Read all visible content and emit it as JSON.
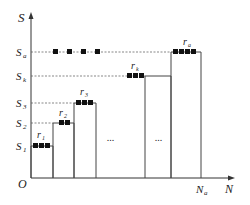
{
  "diagram": {
    "axes": {
      "y_label": "S",
      "x_label": "N",
      "origin_label": "O",
      "x_end_tick_label": "N",
      "x_end_tick_sub": "a"
    },
    "y_levels": [
      {
        "label": "S",
        "sub": "1",
        "y": 146
      },
      {
        "label": "S",
        "sub": "2",
        "y": 123
      },
      {
        "label": "S",
        "sub": "3",
        "y": 103
      },
      {
        "label": "S",
        "sub": "k",
        "y": 76
      },
      {
        "label": "S",
        "sub": "a",
        "y": 52
      }
    ],
    "bars": [
      {
        "label": "r",
        "sub": "1",
        "x1": 31,
        "x2": 53,
        "top": 146,
        "blocks": 3
      },
      {
        "label": "r",
        "sub": "2",
        "x1": 53,
        "x2": 74,
        "top": 123,
        "blocks": 2
      },
      {
        "label": "r",
        "sub": "3",
        "x1": 74,
        "x2": 96,
        "top": 103,
        "blocks": 3
      },
      {
        "label": "r",
        "sub": "k",
        "x1": 145,
        "x2": 171,
        "top": 76,
        "blocks": 3
      },
      {
        "label": "r",
        "sub": "a",
        "x1": 171,
        "x2": 201,
        "top": 52,
        "blocks": 4
      }
    ],
    "ellipses": [
      "...",
      "..."
    ],
    "colors": {
      "axis": "#333333",
      "block": "#111111",
      "dash": "#555555"
    }
  }
}
